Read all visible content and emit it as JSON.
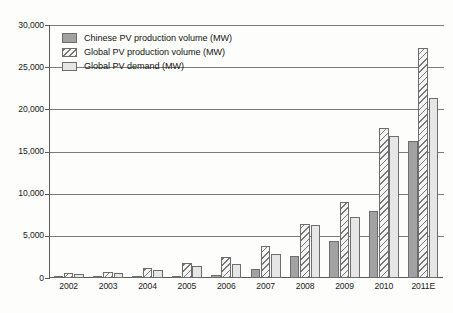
{
  "chart_data": {
    "type": "bar",
    "title": "",
    "xlabel": "",
    "ylabel": "",
    "ylim": [
      0,
      30000
    ],
    "yticks": [
      0,
      5000,
      10000,
      15000,
      20000,
      25000,
      30000
    ],
    "ytick_labels": [
      "0",
      "5,000",
      "10,000",
      "15,000",
      "20,000",
      "25,000",
      "30,000"
    ],
    "grid": true,
    "legend_position": "upper-left",
    "categories": [
      "2002",
      "2003",
      "2004",
      "2005",
      "2006",
      "2007",
      "2008",
      "2009",
      "2010",
      "2011E"
    ],
    "series": [
      {
        "name": "Chinese PV production volume (MW)",
        "fill": "solid-gray",
        "color": "#a2a2a2",
        "values": [
          10,
          20,
          50,
          200,
          400,
          1100,
          2600,
          4400,
          8000,
          16200
        ]
      },
      {
        "name": "Global PV production volume (MW)",
        "fill": "diagonal-hatch",
        "color": "#f4f4f4",
        "values": [
          550,
          750,
          1200,
          1800,
          2500,
          3800,
          6400,
          9000,
          17800,
          27300
        ]
      },
      {
        "name": "Global PV demand (MW)",
        "fill": "light-gray",
        "color": "#e6e6e6",
        "values": [
          450,
          600,
          1000,
          1400,
          1700,
          2900,
          6300,
          7200,
          16800,
          21300
        ]
      }
    ]
  },
  "legend": {
    "items": [
      {
        "label": "Chinese PV production volume (MW)"
      },
      {
        "label": "Global PV production volume (MW)"
      },
      {
        "label": "Global PV demand (MW)"
      }
    ]
  }
}
